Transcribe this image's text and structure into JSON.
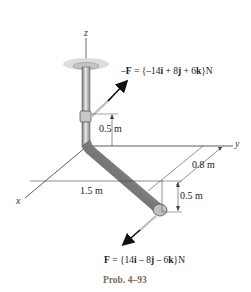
{
  "figure": {
    "caption": "Prob. 4–93",
    "axes": {
      "x": "x",
      "y": "y",
      "z": "z"
    },
    "dimensions": {
      "upper_vertical": "0.5 m",
      "y_offset": "0.8 m",
      "x_length": "1.5 m",
      "lower_vertical": "0.5 m"
    },
    "forces": {
      "top": {
        "prefix": "–",
        "symbol": "F",
        "eq": " = {–14",
        "i": "i",
        "p1": " + 8",
        "j": "j",
        "p2": " + 6",
        "k": "k",
        "unit": "}N"
      },
      "bottom": {
        "prefix": "",
        "symbol": "F",
        "eq": " = {14",
        "i": "i",
        "p1": " – 8",
        "j": "j",
        "p2": " – 6",
        "k": "k",
        "unit": "}N"
      }
    },
    "colors": {
      "pipe": "#b8b8b8",
      "disk": "#d8d8d8",
      "caption": "#7a6a5a",
      "line": "#333333"
    }
  }
}
